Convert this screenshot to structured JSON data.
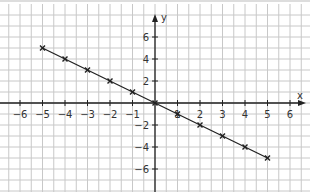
{
  "chart_data": {
    "type": "line",
    "title": "",
    "xlabel": "x",
    "ylabel": "y",
    "x_ticks": [
      -6,
      -5,
      -4,
      -3,
      -2,
      -1,
      1,
      2,
      3,
      4,
      5,
      6
    ],
    "y_ticks": [
      -6,
      -4,
      -2,
      2,
      4,
      6
    ],
    "xlim": [
      -6.8,
      6.8
    ],
    "ylim": [
      -8,
      9
    ],
    "grid": true,
    "series": [
      {
        "name": "y = -x",
        "x": [
          -5,
          -4,
          -3,
          -2,
          -1,
          0,
          1,
          2,
          3,
          4,
          5
        ],
        "y": [
          5,
          4,
          3,
          2,
          1,
          0,
          -1,
          -2,
          -3,
          -4,
          -5
        ],
        "marker": "x",
        "color": "#222222"
      }
    ]
  },
  "colors": {
    "grid": "#c8c8c8",
    "axis": "#222222",
    "line": "#222222",
    "background": "#ffffff"
  }
}
